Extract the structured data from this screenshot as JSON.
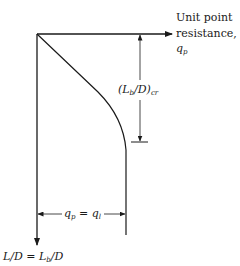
{
  "diagram": {
    "x_axis": {
      "label_line1": "Unit point",
      "label_line2": "resistance,",
      "label_symbol": "q",
      "label_subscript": "p"
    },
    "y_axis": {
      "label_left": "L/D = L",
      "label_sub": "b",
      "label_right": "/D"
    },
    "critical_depth": {
      "label_pre": "(L",
      "label_sub1": "b",
      "label_mid": "/D)",
      "label_sub2": "cr"
    },
    "limit": {
      "label_q": "q",
      "label_sub_p": "p",
      "label_eq": " = q",
      "label_sub_l": "l"
    },
    "colors": {
      "line": "#1a1a1a",
      "background": "#ffffff"
    }
  }
}
